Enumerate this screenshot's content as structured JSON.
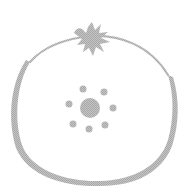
{
  "illustration": {
    "subject": "fruit-outline-icon",
    "colors": {
      "stroke": "#b4b4b4",
      "fill": "#b4b4b4",
      "background": "#ffffff"
    },
    "center_dot": {
      "cx": 90,
      "cy": 108,
      "r": 10
    },
    "small_dots": [
      {
        "cx": 83,
        "cy": 89,
        "r": 3.5
      },
      {
        "cx": 104,
        "cy": 92,
        "r": 3.5
      },
      {
        "cx": 69,
        "cy": 104,
        "r": 3.5
      },
      {
        "cx": 113,
        "cy": 108,
        "r": 3.5
      },
      {
        "cx": 73,
        "cy": 124,
        "r": 3.5
      },
      {
        "cx": 89,
        "cy": 129,
        "r": 3.5
      },
      {
        "cx": 105,
        "cy": 125,
        "r": 3.5
      }
    ]
  }
}
